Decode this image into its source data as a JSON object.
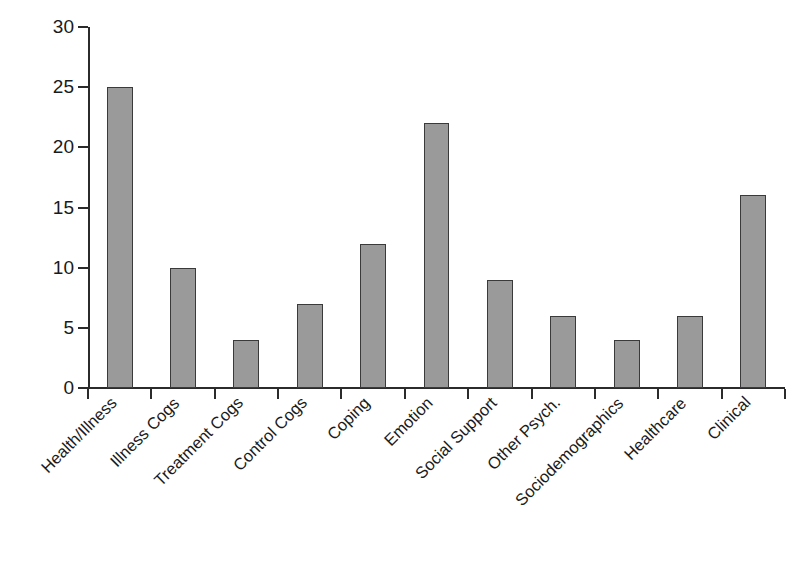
{
  "chart_data": {
    "type": "bar",
    "title": "",
    "subtitle": "",
    "xlabel": "",
    "ylabel": "",
    "categories": [
      "Health/Illness",
      "Illness Cogs",
      "Treatment Cogs",
      "Control Cogs",
      "Coping",
      "Emotion",
      "Social Support",
      "Other Psych.",
      "Sociodemographics",
      "Healthcare",
      "Clinical"
    ],
    "values": [
      25,
      10,
      4,
      7,
      12,
      22,
      9,
      6,
      4,
      6,
      16
    ],
    "ylim": [
      0,
      30
    ],
    "y_ticks": [
      0,
      5,
      10,
      15,
      20,
      25,
      30
    ],
    "y_tick_labels": [
      "0",
      "5",
      "10",
      "15",
      "20",
      "25",
      "30"
    ],
    "grid": false,
    "legend": null,
    "legend_position": "none",
    "bar_fill_color": "#9a9a9a",
    "bar_edge_color": "#3a3a3a",
    "axis_color": "#2b2b2b",
    "background_color": "#ffffff",
    "x_tick_label_rotation": -45
  }
}
